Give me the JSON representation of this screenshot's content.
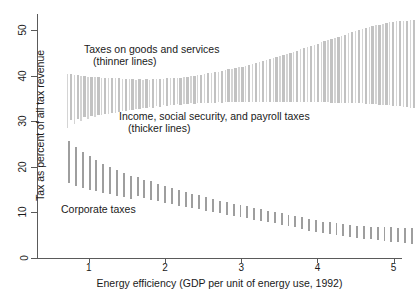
{
  "chart_data": {
    "type": "bar",
    "title": "",
    "subtitle": "",
    "xlabel": "Energy efficiency (GDP per unit of energy use, 1992)",
    "ylabel": "Tax as percent of all tax revenue",
    "xlim": [
      0.6,
      5.42
    ],
    "ylim": [
      0,
      55
    ],
    "xticks": [
      1,
      2,
      3,
      4,
      5
    ],
    "yticks": [
      0,
      10,
      20,
      30,
      40,
      50
    ],
    "grid": false,
    "legend_position": "in-plot annotations",
    "annotations": [
      {
        "name": "goods-and-services",
        "line1": "Taxes on goods and services",
        "line2": "(thinner lines)",
        "x": 1.3,
        "y": 46
      },
      {
        "name": "income-social-payroll",
        "line1": "Income, social security, and payroll taxes",
        "line2": "(thicker lines)",
        "x": 1.78,
        "y": 32
      },
      {
        "name": "corporate",
        "line1": "Corporate taxes",
        "line2": "",
        "x": 0.95,
        "y": 12
      }
    ],
    "note": "Each vertical line is a confidence band (low-high) at an x position. Three interleaved series of range bars.",
    "series": [
      {
        "name": "Taxes on goods and services",
        "style": "thinner lines",
        "color": "#d4d4d4",
        "bars": [
          {
            "x": 0.72,
            "low": 28.6,
            "high": 40.3
          },
          {
            "x": 0.81,
            "low": 29.4,
            "high": 40.1
          },
          {
            "x": 0.9,
            "low": 30.1,
            "high": 39.9
          },
          {
            "x": 0.99,
            "low": 30.6,
            "high": 39.8
          },
          {
            "x": 1.08,
            "low": 31.0,
            "high": 39.7
          },
          {
            "x": 1.17,
            "low": 31.3,
            "high": 39.6
          },
          {
            "x": 1.26,
            "low": 31.6,
            "high": 39.5
          },
          {
            "x": 1.35,
            "low": 31.9,
            "high": 39.4
          },
          {
            "x": 1.44,
            "low": 32.2,
            "high": 39.3
          },
          {
            "x": 1.53,
            "low": 32.4,
            "high": 39.2
          },
          {
            "x": 1.62,
            "low": 32.7,
            "high": 39.1
          },
          {
            "x": 1.71,
            "low": 32.9,
            "high": 39.1
          },
          {
            "x": 1.8,
            "low": 33.1,
            "high": 39.1
          },
          {
            "x": 1.89,
            "low": 33.3,
            "high": 39.2
          },
          {
            "x": 1.98,
            "low": 33.5,
            "high": 39.3
          },
          {
            "x": 2.07,
            "low": 33.6,
            "high": 39.4
          },
          {
            "x": 2.16,
            "low": 33.7,
            "high": 39.5
          },
          {
            "x": 2.25,
            "low": 33.8,
            "high": 39.7
          },
          {
            "x": 2.34,
            "low": 33.9,
            "high": 39.9
          },
          {
            "x": 2.43,
            "low": 34.0,
            "high": 40.1
          },
          {
            "x": 2.52,
            "low": 34.1,
            "high": 40.3
          },
          {
            "x": 2.61,
            "low": 34.1,
            "high": 40.6
          },
          {
            "x": 2.7,
            "low": 34.2,
            "high": 40.9
          },
          {
            "x": 2.79,
            "low": 34.2,
            "high": 41.2
          },
          {
            "x": 2.88,
            "low": 34.3,
            "high": 41.5
          },
          {
            "x": 2.97,
            "low": 34.3,
            "high": 41.8
          },
          {
            "x": 3.06,
            "low": 34.3,
            "high": 42.2
          },
          {
            "x": 3.15,
            "low": 34.3,
            "high": 42.6
          },
          {
            "x": 3.24,
            "low": 34.3,
            "high": 43.0
          },
          {
            "x": 3.33,
            "low": 34.3,
            "high": 43.4
          },
          {
            "x": 3.42,
            "low": 34.3,
            "high": 43.8
          },
          {
            "x": 3.51,
            "low": 34.3,
            "high": 44.3
          },
          {
            "x": 3.6,
            "low": 34.3,
            "high": 44.8
          },
          {
            "x": 3.69,
            "low": 34.3,
            "high": 45.3
          },
          {
            "x": 3.78,
            "low": 34.3,
            "high": 45.8
          },
          {
            "x": 3.87,
            "low": 34.3,
            "high": 46.3
          },
          {
            "x": 3.96,
            "low": 34.2,
            "high": 46.8
          },
          {
            "x": 4.05,
            "low": 34.2,
            "high": 47.3
          },
          {
            "x": 4.14,
            "low": 34.2,
            "high": 47.8
          },
          {
            "x": 4.23,
            "low": 34.1,
            "high": 48.3
          },
          {
            "x": 4.32,
            "low": 34.1,
            "high": 48.8
          },
          {
            "x": 4.41,
            "low": 34.0,
            "high": 49.3
          },
          {
            "x": 4.5,
            "low": 34.0,
            "high": 49.8
          },
          {
            "x": 4.59,
            "low": 33.9,
            "high": 50.3
          },
          {
            "x": 4.68,
            "low": 33.8,
            "high": 50.7
          },
          {
            "x": 4.77,
            "low": 33.7,
            "high": 51.1
          },
          {
            "x": 4.86,
            "low": 33.6,
            "high": 51.4
          },
          {
            "x": 4.95,
            "low": 33.5,
            "high": 51.7
          },
          {
            "x": 5.04,
            "low": 33.4,
            "high": 51.9
          },
          {
            "x": 5.13,
            "low": 33.2,
            "high": 52.0
          },
          {
            "x": 5.22,
            "low": 33.0,
            "high": 52.2
          }
        ]
      },
      {
        "name": "Income, social security, and payroll taxes",
        "style": "thicker lines",
        "color": "#c2c2c2",
        "bars": [
          {
            "x": 0.765,
            "low": 30.2,
            "high": 40.4
          },
          {
            "x": 0.855,
            "low": 30.6,
            "high": 40.2
          },
          {
            "x": 0.945,
            "low": 30.9,
            "high": 40.0
          },
          {
            "x": 1.035,
            "low": 31.2,
            "high": 39.8
          },
          {
            "x": 1.125,
            "low": 31.4,
            "high": 39.7
          },
          {
            "x": 1.215,
            "low": 31.6,
            "high": 39.6
          },
          {
            "x": 1.305,
            "low": 31.8,
            "high": 39.5
          },
          {
            "x": 1.395,
            "low": 32.0,
            "high": 39.4
          },
          {
            "x": 1.485,
            "low": 32.2,
            "high": 39.3
          },
          {
            "x": 1.575,
            "low": 32.4,
            "high": 39.2
          },
          {
            "x": 1.665,
            "low": 32.6,
            "high": 39.2
          },
          {
            "x": 1.755,
            "low": 32.8,
            "high": 39.2
          },
          {
            "x": 1.845,
            "low": 33.0,
            "high": 39.2
          },
          {
            "x": 1.935,
            "low": 33.2,
            "high": 39.3
          },
          {
            "x": 2.025,
            "low": 33.4,
            "high": 39.4
          },
          {
            "x": 2.115,
            "low": 33.5,
            "high": 39.5
          },
          {
            "x": 2.205,
            "low": 33.6,
            "high": 39.6
          },
          {
            "x": 2.295,
            "low": 33.7,
            "high": 39.8
          },
          {
            "x": 2.385,
            "low": 33.8,
            "high": 40.0
          },
          {
            "x": 2.475,
            "low": 33.9,
            "high": 40.2
          },
          {
            "x": 2.565,
            "low": 34.0,
            "high": 40.5
          },
          {
            "x": 2.655,
            "low": 34.1,
            "high": 40.8
          },
          {
            "x": 2.745,
            "low": 34.1,
            "high": 41.1
          },
          {
            "x": 2.835,
            "low": 34.2,
            "high": 41.4
          },
          {
            "x": 2.925,
            "low": 34.2,
            "high": 41.7
          },
          {
            "x": 3.015,
            "low": 34.3,
            "high": 42.0
          },
          {
            "x": 3.105,
            "low": 34.3,
            "high": 42.4
          },
          {
            "x": 3.195,
            "low": 34.3,
            "high": 42.8
          },
          {
            "x": 3.285,
            "low": 34.3,
            "high": 43.2
          },
          {
            "x": 3.375,
            "low": 34.3,
            "high": 43.6
          },
          {
            "x": 3.465,
            "low": 34.3,
            "high": 44.0
          },
          {
            "x": 3.555,
            "low": 34.3,
            "high": 44.5
          },
          {
            "x": 3.645,
            "low": 34.3,
            "high": 45.0
          },
          {
            "x": 3.735,
            "low": 34.3,
            "high": 45.5
          },
          {
            "x": 3.825,
            "low": 34.3,
            "high": 46.0
          },
          {
            "x": 3.915,
            "low": 34.2,
            "high": 46.5
          },
          {
            "x": 4.005,
            "low": 34.2,
            "high": 47.0
          },
          {
            "x": 4.095,
            "low": 34.2,
            "high": 47.5
          },
          {
            "x": 4.185,
            "low": 34.1,
            "high": 48.0
          },
          {
            "x": 4.275,
            "low": 34.1,
            "high": 48.5
          },
          {
            "x": 4.365,
            "low": 34.0,
            "high": 49.0
          },
          {
            "x": 4.455,
            "low": 34.0,
            "high": 49.5
          },
          {
            "x": 4.545,
            "low": 33.9,
            "high": 50.0
          },
          {
            "x": 4.635,
            "low": 33.8,
            "high": 50.5
          },
          {
            "x": 4.725,
            "low": 33.7,
            "high": 50.9
          },
          {
            "x": 4.815,
            "low": 33.6,
            "high": 51.2
          },
          {
            "x": 4.905,
            "low": 33.5,
            "high": 51.5
          },
          {
            "x": 4.995,
            "low": 33.4,
            "high": 51.8
          },
          {
            "x": 5.085,
            "low": 33.3,
            "high": 52.0
          },
          {
            "x": 5.175,
            "low": 33.1,
            "high": 52.1
          },
          {
            "x": 5.265,
            "low": 32.9,
            "high": 52.2
          }
        ]
      },
      {
        "name": "Corporate taxes",
        "style": "thicker lines",
        "color": "#9e9e9e",
        "bars": [
          {
            "x": 0.74,
            "low": 16.4,
            "high": 25.7
          },
          {
            "x": 0.83,
            "low": 15.8,
            "high": 24.4
          },
          {
            "x": 0.92,
            "low": 15.3,
            "high": 23.3
          },
          {
            "x": 1.01,
            "low": 14.9,
            "high": 22.3
          },
          {
            "x": 1.1,
            "low": 14.6,
            "high": 21.4
          },
          {
            "x": 1.19,
            "low": 14.3,
            "high": 20.6
          },
          {
            "x": 1.28,
            "low": 14.0,
            "high": 19.9
          },
          {
            "x": 1.37,
            "low": 13.7,
            "high": 19.3
          },
          {
            "x": 1.46,
            "low": 13.3,
            "high": 18.7
          },
          {
            "x": 1.55,
            "low": 13.0,
            "high": 18.1
          },
          {
            "x": 1.64,
            "low": 13.5,
            "high": 17.7
          },
          {
            "x": 1.73,
            "low": 13.1,
            "high": 17.2
          },
          {
            "x": 1.82,
            "low": 12.7,
            "high": 16.8
          },
          {
            "x": 1.91,
            "low": 12.4,
            "high": 16.3
          },
          {
            "x": 2.0,
            "low": 12.1,
            "high": 15.8
          },
          {
            "x": 2.09,
            "low": 11.8,
            "high": 15.3
          },
          {
            "x": 2.18,
            "low": 11.5,
            "high": 14.9
          },
          {
            "x": 2.27,
            "low": 11.2,
            "high": 14.5
          },
          {
            "x": 2.36,
            "low": 11.0,
            "high": 14.1
          },
          {
            "x": 2.45,
            "low": 10.7,
            "high": 13.8
          },
          {
            "x": 2.54,
            "low": 10.4,
            "high": 13.4
          },
          {
            "x": 2.63,
            "low": 10.1,
            "high": 13.0
          },
          {
            "x": 2.72,
            "low": 9.8,
            "high": 12.6
          },
          {
            "x": 2.81,
            "low": 9.5,
            "high": 12.3
          },
          {
            "x": 2.9,
            "low": 9.2,
            "high": 11.9
          },
          {
            "x": 2.99,
            "low": 8.9,
            "high": 11.6
          },
          {
            "x": 3.08,
            "low": 8.7,
            "high": 11.3
          },
          {
            "x": 3.17,
            "low": 8.4,
            "high": 11.0
          },
          {
            "x": 3.26,
            "low": 8.1,
            "high": 10.7
          },
          {
            "x": 3.35,
            "low": 7.8,
            "high": 10.4
          },
          {
            "x": 3.44,
            "low": 7.6,
            "high": 10.1
          },
          {
            "x": 3.53,
            "low": 7.3,
            "high": 9.8
          },
          {
            "x": 3.62,
            "low": 7.0,
            "high": 9.5
          },
          {
            "x": 3.71,
            "low": 6.7,
            "high": 9.2
          },
          {
            "x": 3.8,
            "low": 6.4,
            "high": 8.9
          },
          {
            "x": 3.89,
            "low": 6.0,
            "high": 8.6
          },
          {
            "x": 3.98,
            "low": 5.7,
            "high": 8.3
          },
          {
            "x": 4.07,
            "low": 5.4,
            "high": 8.0
          },
          {
            "x": 4.16,
            "low": 5.2,
            "high": 7.8
          },
          {
            "x": 4.25,
            "low": 5.0,
            "high": 7.6
          },
          {
            "x": 4.34,
            "low": 4.8,
            "high": 7.4
          },
          {
            "x": 4.43,
            "low": 4.6,
            "high": 7.2
          },
          {
            "x": 4.52,
            "low": 4.4,
            "high": 7.1
          },
          {
            "x": 4.61,
            "low": 4.2,
            "high": 7.0
          },
          {
            "x": 4.7,
            "low": 4.1,
            "high": 6.9
          },
          {
            "x": 4.79,
            "low": 3.9,
            "high": 6.8
          },
          {
            "x": 4.88,
            "low": 3.8,
            "high": 6.7
          },
          {
            "x": 4.97,
            "low": 3.6,
            "high": 6.7
          },
          {
            "x": 5.06,
            "low": 3.4,
            "high": 6.6
          },
          {
            "x": 5.15,
            "low": 3.2,
            "high": 6.6
          },
          {
            "x": 5.24,
            "low": 3.0,
            "high": 6.5
          }
        ]
      }
    ]
  },
  "axes": {
    "x_title": "Energy efficiency (GDP per unit of energy use, 1992)",
    "y_title": "Tax as percent of all tax revenue",
    "x_tick_labels": [
      "1",
      "2",
      "3",
      "4",
      "5"
    ],
    "y_tick_labels": [
      "0",
      "10",
      "20",
      "30",
      "40",
      "50"
    ]
  },
  "colors": {
    "axis": "#5a5a5a",
    "text": "#1a1a1a",
    "goods_series": "#d4d4d4",
    "income_series": "#c2c2c2",
    "corporate_series": "#9e9e9e",
    "background": "#ffffff"
  }
}
